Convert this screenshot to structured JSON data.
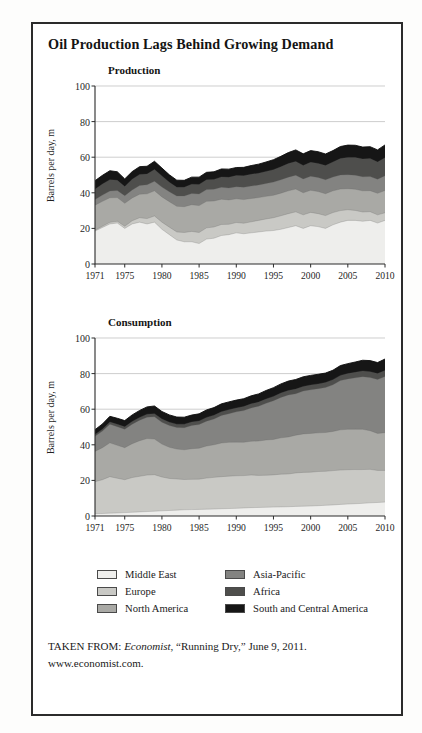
{
  "figure": {
    "title": "Oil Production Lags Behind Growing Demand",
    "source_prefix": "TAKEN FROM: ",
    "source_publication": "Economist",
    "source_rest": ", “Running Dry,” June 9, 2011.",
    "source_url": "www.economist.com.",
    "border_color": "#2b2b2b",
    "background": "#ffffff"
  },
  "legend": {
    "left_column": [
      {
        "label": "Middle East",
        "color": "#eeeeec"
      },
      {
        "label": "Europe",
        "color": "#c9c9c5"
      },
      {
        "label": "North America",
        "color": "#a9a9a5"
      }
    ],
    "right_column": [
      {
        "label": "Asia-Pacific",
        "color": "#838381"
      },
      {
        "label": "Africa",
        "color": "#4e4e4c"
      },
      {
        "label": "South and Central America",
        "color": "#161616"
      }
    ]
  },
  "chart_data": [
    {
      "type": "area",
      "stacked": true,
      "title": "Production",
      "xlabel": "",
      "ylabel": "Barrels per day, m",
      "ylim": [
        0,
        100
      ],
      "yticks": [
        0,
        20,
        40,
        60,
        80,
        100
      ],
      "grid": true,
      "xlim": [
        1971,
        2010
      ],
      "xticks": [
        1971,
        1975,
        1980,
        1985,
        1990,
        1995,
        2000,
        2005,
        2010
      ],
      "x": [
        1971,
        1972,
        1973,
        1974,
        1975,
        1976,
        1977,
        1978,
        1979,
        1980,
        1981,
        1982,
        1983,
        1984,
        1985,
        1986,
        1987,
        1988,
        1989,
        1990,
        1991,
        1992,
        1993,
        1994,
        1995,
        1996,
        1997,
        1998,
        1999,
        2000,
        2001,
        2002,
        2003,
        2004,
        2005,
        2006,
        2007,
        2008,
        2009,
        2010
      ],
      "series": [
        {
          "name": "Middle East",
          "color": "#eeeeec",
          "values": [
            18.5,
            20.5,
            22.5,
            23.0,
            20.0,
            22.5,
            23.5,
            22.5,
            23.5,
            19.5,
            16.5,
            13.5,
            12.5,
            12.5,
            11.5,
            14.0,
            14.5,
            16.0,
            16.5,
            17.5,
            17.0,
            17.5,
            18.0,
            18.5,
            18.8,
            19.5,
            20.5,
            21.5,
            20.0,
            21.5,
            21.0,
            20.0,
            22.0,
            23.5,
            24.5,
            24.5,
            24.0,
            24.5,
            23.0,
            24.5
          ]
        },
        {
          "name": "Europe",
          "color": "#c9c9c5",
          "values": [
            0.5,
            0.7,
            0.9,
            1.0,
            1.2,
            1.8,
            2.5,
            3.0,
            3.5,
            4.0,
            4.2,
            4.5,
            5.2,
            5.8,
            6.2,
            6.3,
            6.3,
            6.2,
            5.8,
            5.8,
            5.9,
            6.2,
            6.5,
            6.8,
            7.2,
            7.6,
            7.8,
            7.8,
            7.6,
            7.5,
            7.3,
            7.2,
            6.9,
            6.5,
            6.0,
            5.6,
            5.2,
            4.9,
            4.6,
            4.3
          ]
        },
        {
          "name": "North America",
          "color": "#a9a9a5",
          "values": [
            14.0,
            14.0,
            13.8,
            13.3,
            12.9,
            12.8,
            13.2,
            13.9,
            14.1,
            14.2,
            14.3,
            14.4,
            14.5,
            15.0,
            15.1,
            14.9,
            14.6,
            14.2,
            13.7,
            13.3,
            13.3,
            13.1,
            12.8,
            12.7,
            12.6,
            12.7,
            12.8,
            12.8,
            12.4,
            12.4,
            12.4,
            12.3,
            12.2,
            12.1,
            11.8,
            11.9,
            11.9,
            11.8,
            12.1,
            12.5
          ]
        },
        {
          "name": "Asia-Pacific",
          "color": "#838381",
          "values": [
            3.2,
            3.5,
            3.8,
            4.0,
            4.2,
            4.5,
            4.9,
            5.1,
            5.4,
            5.5,
            5.6,
            5.8,
            6.0,
            6.3,
            6.5,
            6.6,
            6.6,
            6.7,
            6.7,
            6.8,
            6.9,
            7.0,
            7.1,
            7.2,
            7.4,
            7.5,
            7.7,
            7.8,
            7.8,
            7.9,
            7.9,
            7.8,
            7.8,
            7.9,
            7.9,
            7.9,
            7.9,
            7.9,
            7.9,
            8.3
          ]
        },
        {
          "name": "Africa",
          "color": "#4e4e4c",
          "values": [
            5.8,
            6.2,
            6.4,
            5.7,
            5.2,
            6.0,
            6.2,
            6.0,
            6.6,
            6.3,
            5.3,
            4.9,
            4.9,
            5.2,
            5.4,
            5.5,
            5.5,
            5.8,
            6.0,
            6.3,
            6.5,
            6.6,
            6.6,
            6.8,
            7.0,
            7.3,
            7.6,
            7.7,
            7.6,
            7.8,
            7.9,
            8.0,
            8.4,
            9.2,
            9.7,
            9.9,
            10.0,
            10.1,
            9.7,
            10.1
          ]
        },
        {
          "name": "South and Central America",
          "color": "#161616",
          "values": [
            4.8,
            4.9,
            5.0,
            4.8,
            4.3,
            4.3,
            4.4,
            4.4,
            4.6,
            4.4,
            4.2,
            4.0,
            3.9,
            4.0,
            4.1,
            4.2,
            4.3,
            4.5,
            4.6,
            4.5,
            4.7,
            4.9,
            5.1,
            5.3,
            5.6,
            5.9,
            6.2,
            6.5,
            6.5,
            6.6,
            6.6,
            6.5,
            6.4,
            6.8,
            6.9,
            6.9,
            6.7,
            6.7,
            6.8,
            7.2
          ]
        }
      ]
    },
    {
      "type": "area",
      "stacked": true,
      "title": "Consumption",
      "xlabel": "",
      "ylabel": "Barrels per day, m",
      "ylim": [
        0,
        100
      ],
      "yticks": [
        0,
        20,
        40,
        60,
        80,
        100
      ],
      "grid": true,
      "xlim": [
        1971,
        2010
      ],
      "xticks": [
        1971,
        1975,
        1980,
        1985,
        1990,
        1995,
        2000,
        2005,
        2010
      ],
      "x": [
        1971,
        1972,
        1973,
        1974,
        1975,
        1976,
        1977,
        1978,
        1979,
        1980,
        1981,
        1982,
        1983,
        1984,
        1985,
        1986,
        1987,
        1988,
        1989,
        1990,
        1991,
        1992,
        1993,
        1994,
        1995,
        1996,
        1997,
        1998,
        1999,
        2000,
        2001,
        2002,
        2003,
        2004,
        2005,
        2006,
        2007,
        2008,
        2009,
        2010
      ],
      "series": [
        {
          "name": "Middle East",
          "color": "#eeeeec",
          "values": [
            1.3,
            1.4,
            1.6,
            1.7,
            1.9,
            2.1,
            2.3,
            2.5,
            2.7,
            2.9,
            3.1,
            3.3,
            3.5,
            3.6,
            3.7,
            3.8,
            3.9,
            4.1,
            4.2,
            4.3,
            4.5,
            4.7,
            4.8,
            4.9,
            5.0,
            5.1,
            5.2,
            5.4,
            5.5,
            5.6,
            5.8,
            6.0,
            6.2,
            6.5,
            6.7,
            6.9,
            7.1,
            7.4,
            7.6,
            7.8
          ]
        },
        {
          "name": "Europe",
          "color": "#c9c9c5",
          "values": [
            18.0,
            19.0,
            20.5,
            19.5,
            18.5,
            19.5,
            20.0,
            20.5,
            20.5,
            19.0,
            18.0,
            17.5,
            17.0,
            17.0,
            17.0,
            17.5,
            17.8,
            18.0,
            18.2,
            18.3,
            18.2,
            18.3,
            18.0,
            18.0,
            18.1,
            18.4,
            18.4,
            18.8,
            19.0,
            19.0,
            19.2,
            19.1,
            19.3,
            19.3,
            19.3,
            19.2,
            19.0,
            18.8,
            18.0,
            17.8
          ]
        },
        {
          "name": "North America",
          "color": "#a9a9a5",
          "values": [
            17.0,
            18.0,
            19.0,
            18.5,
            18.0,
            19.0,
            20.0,
            20.5,
            20.0,
            18.5,
            17.5,
            16.8,
            16.7,
            17.2,
            17.4,
            18.0,
            18.3,
            18.9,
            19.0,
            18.9,
            18.7,
            19.0,
            19.3,
            19.8,
            19.9,
            20.4,
            20.8,
            21.2,
            21.6,
            21.8,
            21.7,
            21.8,
            22.0,
            22.6,
            22.7,
            22.6,
            22.6,
            21.7,
            20.8,
            21.2
          ]
        },
        {
          "name": "Asia-Pacific",
          "color": "#838381",
          "values": [
            8.5,
            9.3,
            10.5,
            10.5,
            10.3,
            11.0,
            11.5,
            12.0,
            12.5,
            12.3,
            12.2,
            12.1,
            12.4,
            13.0,
            13.3,
            14.0,
            14.5,
            15.4,
            16.1,
            17.0,
            17.8,
            18.7,
            19.6,
            20.6,
            21.8,
            22.7,
            23.6,
            23.3,
            24.1,
            24.5,
            24.8,
            25.3,
            26.2,
            27.7,
            28.3,
            28.9,
            29.6,
            29.9,
            30.3,
            31.6
          ]
        },
        {
          "name": "Africa",
          "color": "#4e4e4c",
          "values": [
            1.0,
            1.1,
            1.2,
            1.3,
            1.4,
            1.5,
            1.6,
            1.7,
            1.8,
            1.8,
            1.9,
            1.9,
            2.0,
            2.0,
            2.0,
            2.1,
            2.1,
            2.2,
            2.2,
            2.2,
            2.3,
            2.3,
            2.3,
            2.4,
            2.4,
            2.5,
            2.5,
            2.6,
            2.6,
            2.7,
            2.7,
            2.8,
            2.9,
            2.9,
            3.0,
            3.1,
            3.2,
            3.3,
            3.3,
            3.4
          ]
        },
        {
          "name": "South and Central America",
          "color": "#161616",
          "values": [
            2.7,
            2.9,
            3.2,
            3.4,
            3.5,
            3.7,
            3.9,
            4.1,
            4.3,
            4.2,
            4.1,
            4.0,
            3.9,
            3.9,
            4.0,
            4.2,
            4.3,
            4.4,
            4.4,
            4.4,
            4.4,
            4.5,
            4.6,
            4.8,
            4.9,
            5.1,
            5.3,
            5.4,
            5.4,
            5.4,
            5.4,
            5.3,
            5.3,
            5.5,
            5.6,
            5.8,
            6.0,
            6.2,
            6.2,
            6.4
          ]
        }
      ]
    }
  ]
}
